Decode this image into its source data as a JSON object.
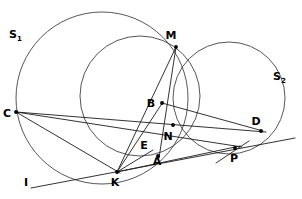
{
  "figure": {
    "background_color": "#ffffff",
    "stroke_color": "#2b2b2b",
    "label_color": "#000000",
    "width": 302,
    "height": 199
  },
  "circles": [
    {
      "name": "S1",
      "label": "S",
      "subscript": "1",
      "cx": 102,
      "cy": 98,
      "r": 86,
      "label_x": 13,
      "label_y": 38
    },
    {
      "name": "S2",
      "label": "S",
      "subscript": "2",
      "cx": 229,
      "cy": 98,
      "r": 56,
      "label_x": 277,
      "label_y": 80
    },
    {
      "name": "S3",
      "label": "",
      "subscript": "",
      "cx": 140,
      "cy": 96,
      "r": 60,
      "label_x": 0,
      "label_y": 0
    }
  ],
  "points": [
    {
      "id": "M",
      "label": "M",
      "x": 176,
      "y": 47,
      "label_x": 171,
      "label_y": 39,
      "marked": true
    },
    {
      "id": "N",
      "label": "N",
      "x": 173,
      "y": 125,
      "label_x": 168,
      "label_y": 140,
      "marked": true
    },
    {
      "id": "B",
      "label": "B",
      "x": 162,
      "y": 103,
      "label_x": 149,
      "label_y": 106,
      "marked": true
    },
    {
      "id": "C",
      "label": "C",
      "x": 16,
      "y": 112,
      "label_x": 5,
      "label_y": 117,
      "marked": true
    },
    {
      "id": "D",
      "label": "D",
      "x": 261,
      "y": 131,
      "label_x": 253,
      "label_y": 126,
      "marked": true
    },
    {
      "id": "E",
      "label": "E",
      "x": 152,
      "y": 151,
      "label_x": 142,
      "label_y": 150,
      "marked": false
    },
    {
      "id": "A",
      "label": "A",
      "x": 158,
      "y": 156,
      "label_x": 155,
      "label_y": 162,
      "marked": true
    },
    {
      "id": "K",
      "label": "K",
      "x": 117,
      "y": 172,
      "label_x": 113,
      "label_y": 186,
      "marked": true
    },
    {
      "id": "P",
      "label": "P",
      "x": 235,
      "y": 148,
      "label_x": 230,
      "label_y": 160,
      "marked": true
    },
    {
      "id": "I",
      "label": "I",
      "x": 28,
      "y": 188,
      "label_x": 26,
      "label_y": 192,
      "marked": false
    }
  ],
  "segments": [
    {
      "name": "line-C-D",
      "x1": 16,
      "y1": 112,
      "x2": 266,
      "y2": 132
    },
    {
      "name": "line-C-P",
      "x1": 16,
      "y1": 112,
      "x2": 242,
      "y2": 147
    },
    {
      "name": "line-C-K",
      "x1": 16,
      "y1": 112,
      "x2": 120,
      "y2": 173
    },
    {
      "name": "line-I-K-D",
      "x1": 31,
      "y1": 188,
      "x2": 295,
      "y2": 138
    },
    {
      "name": "line-K-M",
      "x1": 117,
      "y1": 172,
      "x2": 176,
      "y2": 47
    },
    {
      "name": "line-K-B",
      "x1": 117,
      "y1": 172,
      "x2": 163,
      "y2": 102
    },
    {
      "name": "line-K-E",
      "x1": 117,
      "y1": 172,
      "x2": 153,
      "y2": 150
    },
    {
      "name": "line-K-P",
      "x1": 117,
      "y1": 172,
      "x2": 240,
      "y2": 146
    },
    {
      "name": "line-M-N-A",
      "x1": 176,
      "y1": 47,
      "x2": 159,
      "y2": 158
    },
    {
      "name": "line-B-D",
      "x1": 162,
      "y1": 103,
      "x2": 263,
      "y2": 131
    },
    {
      "name": "tangent-at-P",
      "x1": 216,
      "y1": 163,
      "x2": 249,
      "y2": 141
    }
  ],
  "labels": {
    "s1": "S",
    "s1_sub": "1",
    "s2": "S",
    "s2_sub": "2",
    "i_line": "I"
  }
}
